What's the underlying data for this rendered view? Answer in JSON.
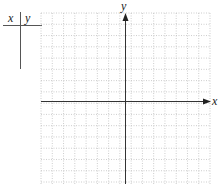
{
  "table": {
    "col_x": "x",
    "col_y": "y"
  },
  "axes": {
    "x_label": "x",
    "y_label": "y"
  },
  "grid": {
    "columns": 15,
    "rows": 15,
    "style": "dotted"
  }
}
